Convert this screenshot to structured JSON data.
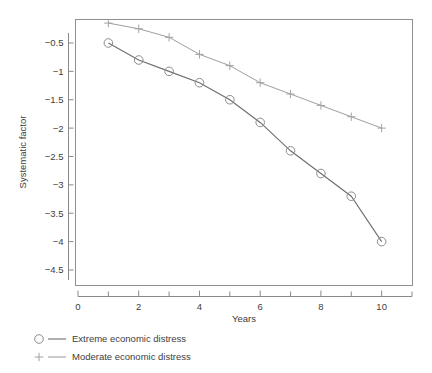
{
  "chart_data": {
    "type": "line",
    "title": "",
    "subtitle": "",
    "xlabel": "Years",
    "ylabel": "Systematic factor",
    "x": [
      1,
      2,
      3,
      4,
      5,
      6,
      7,
      8,
      9,
      10
    ],
    "xlim": [
      0,
      11
    ],
    "ylim": [
      -4.5,
      0
    ],
    "grid": false,
    "legend_position": "below-left",
    "x_ticks_major": [
      "0",
      "2",
      "4",
      "6",
      "8",
      "10"
    ],
    "x_tick_values_major": [
      0,
      2,
      4,
      6,
      8,
      10
    ],
    "x_tick_values_minor": [
      1,
      3,
      5,
      7,
      9,
      11
    ],
    "y_ticks": [
      "−0.5",
      "−1",
      "−1.5",
      "−2",
      "−2.5",
      "−3",
      "−3.5",
      "−4",
      "−4.5"
    ],
    "y_tick_values": [
      -0.5,
      -1,
      -1.5,
      -2,
      -2.5,
      -3,
      -3.5,
      -4,
      -4.5
    ],
    "series": [
      {
        "name": "Extreme economic distress",
        "marker": "circle",
        "color": "#6e6e6e",
        "values": [
          -0.5,
          -0.8,
          -1.0,
          -1.2,
          -1.5,
          -1.9,
          -2.4,
          -2.8,
          -3.2,
          -4.0
        ]
      },
      {
        "name": "Moderate economic distress",
        "marker": "plus",
        "color": "#9e9e9e",
        "values": [
          -0.15,
          -0.25,
          -0.4,
          -0.7,
          -0.9,
          -1.2,
          -1.4,
          -1.6,
          -1.8,
          -2.0
        ]
      }
    ]
  },
  "legend": {
    "entries": [
      {
        "label": "Extreme economic distress",
        "marker": "circle-marker-icon"
      },
      {
        "label": "Moderate economic distress",
        "marker": "plus-marker-icon"
      }
    ]
  },
  "colors": {
    "extreme": "#6e6e6e",
    "moderate": "#9e9e9e",
    "axis": "#8a8a8a",
    "text": "#3d3d3d",
    "background": "#ffffff"
  }
}
